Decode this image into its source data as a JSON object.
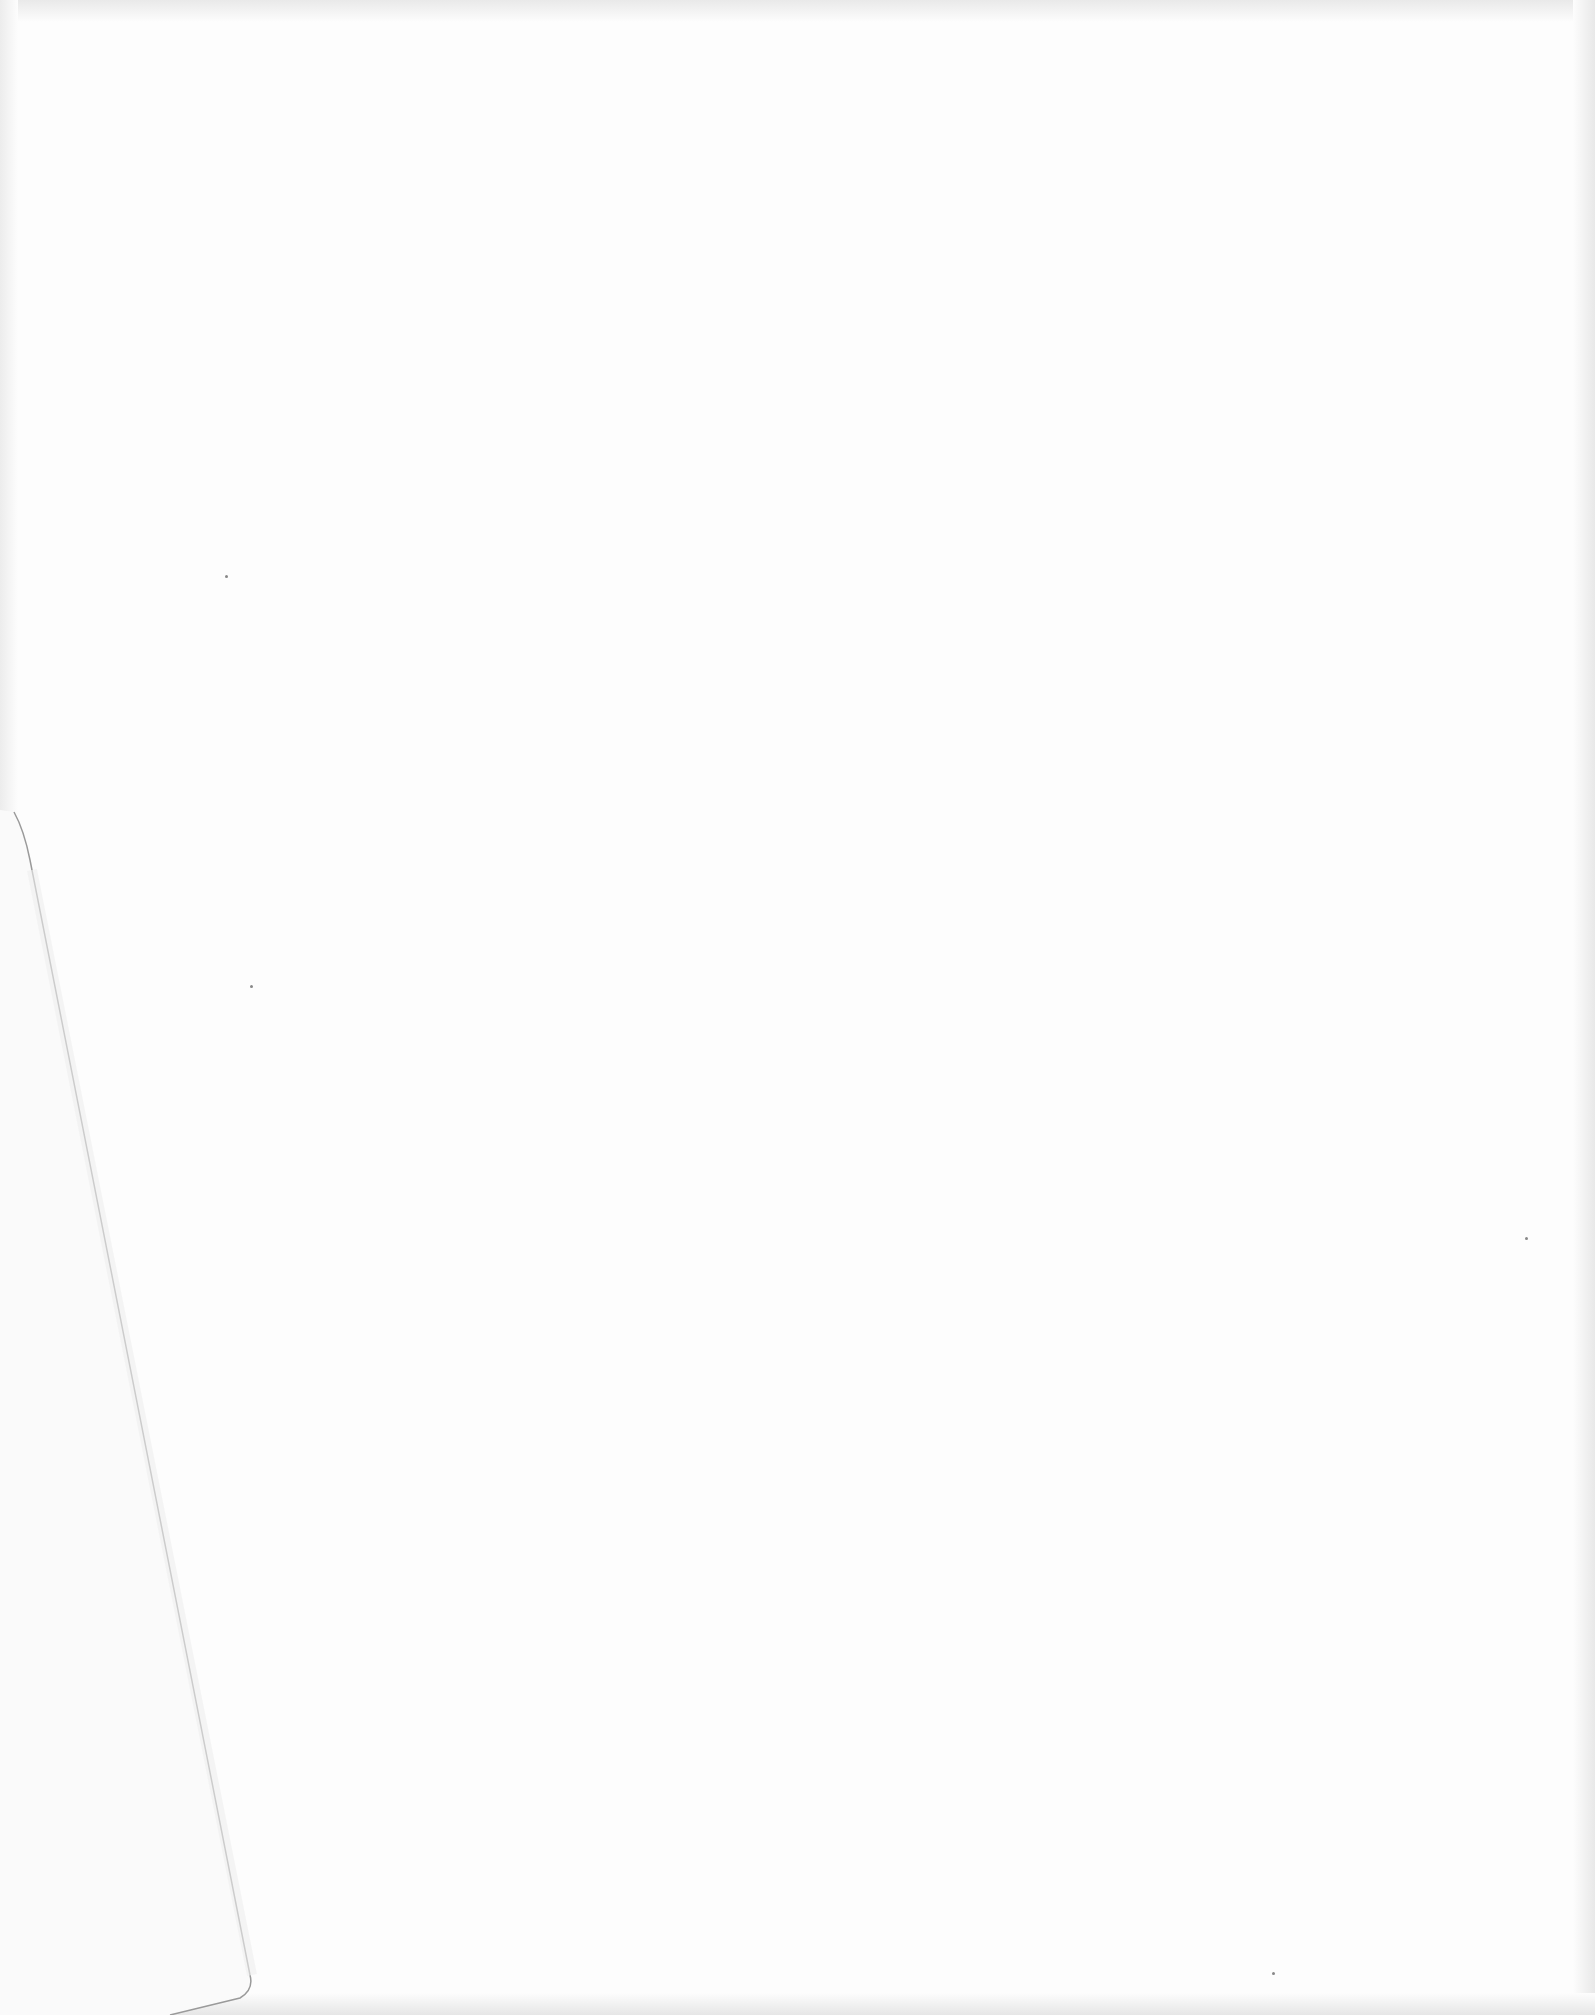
{
  "page": {
    "type": "blank-scanned-page",
    "background_color": "#fdfdfd",
    "fold_line_color": "#9a9a9a"
  }
}
